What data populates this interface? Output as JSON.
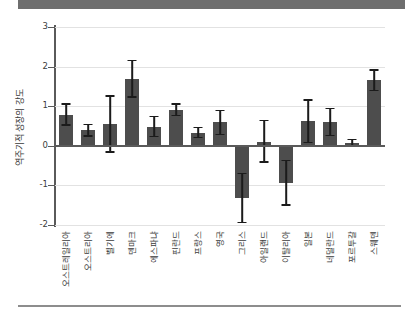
{
  "chart_data": {
    "type": "bar",
    "title": "",
    "subtitle": "",
    "xlabel": "",
    "ylabel": "역주기적 성장의 강도",
    "ylim": [
      -2,
      3
    ],
    "yticks": [
      3,
      2,
      1,
      0,
      -1,
      -2
    ],
    "ytick_labels": [
      "3",
      "2",
      "1",
      "0",
      "-1",
      "-2"
    ],
    "grid": true,
    "legend": null,
    "error_bars": true,
    "categories": [
      "오스트레일리아",
      "오스트리아",
      "벨기에",
      "덴마크",
      "에스파냐",
      "핀란드",
      "프랑스",
      "영국",
      "그리스",
      "아일랜드",
      "이탈리아",
      "일본",
      "네덜란드",
      "포르투갈",
      "스웨덴"
    ],
    "values": [
      0.79,
      0.4,
      0.56,
      1.69,
      0.48,
      0.91,
      0.33,
      0.59,
      -1.31,
      0.09,
      -0.93,
      0.62,
      0.6,
      0.07,
      1.65
    ],
    "err_low": [
      0.52,
      0.25,
      -0.15,
      1.23,
      0.23,
      0.76,
      0.21,
      0.29,
      -1.94,
      -0.41,
      -1.5,
      0.08,
      0.26,
      -0.02,
      1.4
    ],
    "err_high": [
      1.06,
      0.54,
      1.26,
      2.15,
      0.74,
      1.06,
      0.46,
      0.89,
      -0.7,
      0.64,
      -0.37,
      1.15,
      0.94,
      0.16,
      1.91
    ],
    "bar_color": "#4d4d4d",
    "error_color": "#1b1b1b",
    "grid_color": "#e2e2e2",
    "axis_color": "#5a5a5a"
  },
  "banner": {
    "color": "#6e6e6e"
  },
  "footer_rule": {
    "color": "#8d8d8d"
  }
}
